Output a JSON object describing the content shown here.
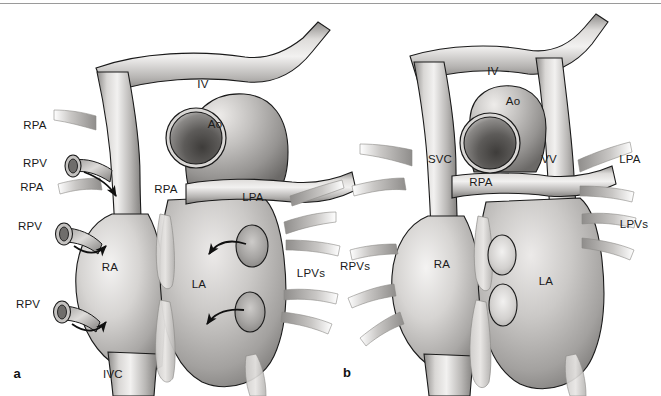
{
  "figure": {
    "width": 661,
    "height": 396,
    "background_color": "#ffffff",
    "top_rule_color": "#9a9a9a",
    "outline_color": "#1a1a1a",
    "label_color": "#1a1a1a",
    "vessel_fill_light": "#f0efee",
    "vessel_fill_mid": "#b8b6b4",
    "vessel_fill_dark": "#6e6c6a",
    "aorta_lumen_dark": "#4a4846"
  },
  "panels": [
    {
      "id": "a",
      "letter": "a",
      "letter_x": 17,
      "letter_y": 373,
      "labels": [
        {
          "text": "RPA",
          "x": 35,
          "y": 126,
          "name": "label-rpa-left-upper"
        },
        {
          "text": "RPV",
          "x": 35,
          "y": 164,
          "name": "label-rpv-left-1"
        },
        {
          "text": "RPA",
          "x": 32,
          "y": 188,
          "name": "label-rpa-left-lower"
        },
        {
          "text": "RPV",
          "x": 30,
          "y": 227,
          "name": "label-rpv-left-2"
        },
        {
          "text": "RPV",
          "x": 28,
          "y": 305,
          "name": "label-rpv-left-3"
        },
        {
          "text": "IV",
          "x": 203,
          "y": 85,
          "name": "label-iv"
        },
        {
          "text": "Ao",
          "x": 215,
          "y": 125,
          "name": "label-ao"
        },
        {
          "text": "RPA",
          "x": 166,
          "y": 190,
          "name": "label-rpa-center"
        },
        {
          "text": "LPA",
          "x": 253,
          "y": 198,
          "name": "label-lpa"
        },
        {
          "text": "RA",
          "x": 110,
          "y": 268,
          "name": "label-ra"
        },
        {
          "text": "LA",
          "x": 199,
          "y": 285,
          "name": "label-la"
        },
        {
          "text": "LPVs",
          "x": 311,
          "y": 274,
          "name": "label-lpvs"
        },
        {
          "text": "IVC",
          "x": 113,
          "y": 375,
          "name": "label-ivc"
        }
      ]
    },
    {
      "id": "b",
      "letter": "b",
      "letter_x": 347,
      "letter_y": 372,
      "labels": [
        {
          "text": "IV",
          "x": 493,
          "y": 72,
          "name": "label-iv-b"
        },
        {
          "text": "Ao",
          "x": 513,
          "y": 102,
          "name": "label-ao-b"
        },
        {
          "text": "SVC",
          "x": 440,
          "y": 160,
          "name": "label-svc-b"
        },
        {
          "text": "VV",
          "x": 549,
          "y": 160,
          "name": "label-vv-b"
        },
        {
          "text": "RPA",
          "x": 481,
          "y": 183,
          "name": "label-rpa-b"
        },
        {
          "text": "LPA",
          "x": 630,
          "y": 160,
          "name": "label-lpa-b"
        },
        {
          "text": "LPVs",
          "x": 634,
          "y": 225,
          "name": "label-lpvs-b"
        },
        {
          "text": "RPVs",
          "x": 355,
          "y": 267,
          "name": "label-rpvs-b"
        },
        {
          "text": "RA",
          "x": 442,
          "y": 265,
          "name": "label-ra-b"
        },
        {
          "text": "LA",
          "x": 546,
          "y": 282,
          "name": "label-la-b"
        }
      ]
    }
  ]
}
